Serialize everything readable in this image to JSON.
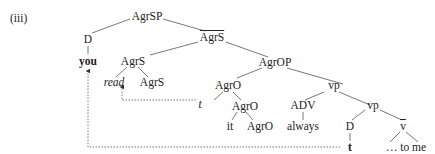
{
  "example_label": "(iii)",
  "nodes": {
    "agrsp": "AgrSP",
    "d_subj": "D",
    "you": "you",
    "agrs_bar": "AgrS",
    "agrs_head": "AgrS",
    "read": "read",
    "agrs_inner": "AgrS",
    "agrop": "AgrOP",
    "agro_bar": "AgrO",
    "t_trace": "t",
    "agro_head": "AgrO",
    "it": "it",
    "agro_inner": "AgrO",
    "vp_upper": "vp",
    "adv": "ADV",
    "always": "always",
    "vp_lower": "vp",
    "d_obj": "D",
    "t_bold": "t",
    "v_bar": "v",
    "to_me": "… to me"
  }
}
